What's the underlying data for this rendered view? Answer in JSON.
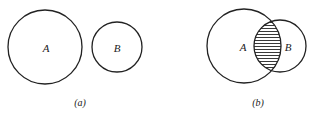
{
  "diagram": {
    "type": "venn-diagram",
    "panels": [
      {
        "caption": "(a)",
        "description": "disjoint sets",
        "sets": [
          {
            "label": "A",
            "cx": 45,
            "cy": 47,
            "r": 37
          },
          {
            "label": "B",
            "cx": 117,
            "cy": 47,
            "r": 25
          }
        ],
        "shaded_region": "none"
      },
      {
        "caption": "(b)",
        "description": "intersecting sets, intersection shaded",
        "sets": [
          {
            "label": "A",
            "cx": 244,
            "cy": 46,
            "r": 37
          },
          {
            "label": "B",
            "cx": 280,
            "cy": 46,
            "r": 26
          }
        ],
        "shaded_region": "A ∩ B",
        "shading_style": "horizontal-hatch"
      }
    ],
    "colors": {
      "stroke": "#222222",
      "background": "#ffffff"
    }
  }
}
